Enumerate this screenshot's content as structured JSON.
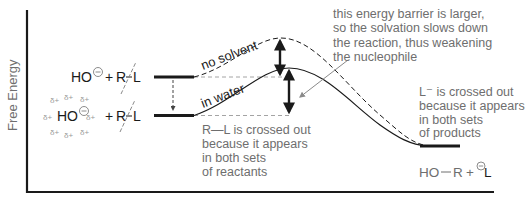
{
  "axes": {
    "y_label": "Free Energy",
    "x_label": ""
  },
  "reactants_no_solvent": {
    "nucleophile": "HO",
    "charge": "−",
    "plus": "+",
    "substrate_R": "R",
    "substrate_bond": "—",
    "substrate_L": "L"
  },
  "reactants_in_water": {
    "nucleophile": "HO",
    "charge": "−",
    "plus": "+",
    "substrate_R": "R",
    "substrate_L": "L",
    "partial_charge": "δ+"
  },
  "curve_labels": {
    "no_solvent": "no solvent",
    "in_water": "in water"
  },
  "annotations": {
    "barrier": [
      "this energy barrier is larger,",
      "so the solvation slows down",
      "the reaction, thus weakening",
      "the nucleophile"
    ],
    "rl_crossed": [
      "R—L is crossed out",
      "because it appears",
      "in both sets",
      "of reactants"
    ],
    "l_crossed": [
      "L⁻ is crossed out",
      "because it appears",
      "in both sets",
      "of products"
    ]
  },
  "products": {
    "left": "HO",
    "bond": "—",
    "right": "R",
    "plus": "+",
    "charge": "−",
    "leaving": "L"
  },
  "colors": {
    "ink": "#1a1a1a",
    "annotation": "#6e6e6e",
    "solvent": "#9a9a9a"
  }
}
